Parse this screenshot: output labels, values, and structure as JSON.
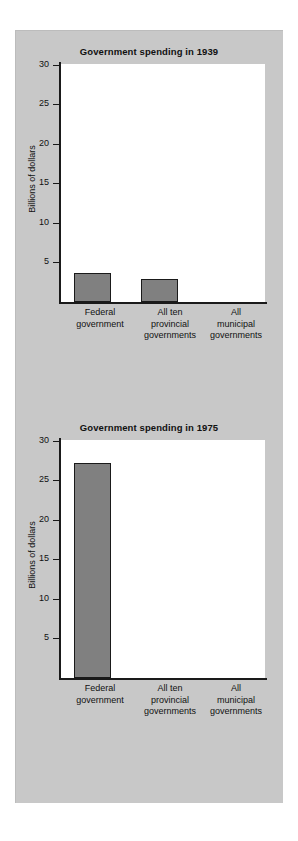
{
  "page": {
    "background_color": "#ffffff",
    "panel_color": "#c8c8c8"
  },
  "chart_data": [
    {
      "type": "bar",
      "title": "Government spending in 1939",
      "xlabel": "",
      "ylabel": "Billions of dollars",
      "categories": [
        "Federal government",
        "All ten provincial governments",
        "All municipal governments"
      ],
      "category_lines": [
        [
          "Federal",
          "government"
        ],
        [
          "All ten",
          "provincial",
          "governments"
        ],
        [
          "All",
          "municipal",
          "governments"
        ]
      ],
      "values": [
        3.8,
        3.1,
        0
      ],
      "ylim": [
        0,
        31.5
      ],
      "yticks": [
        5,
        10,
        15,
        20,
        25,
        30
      ],
      "ytick_labels": [
        "5",
        "10",
        "15",
        "20",
        "25",
        "30"
      ],
      "grid": false,
      "legend": "none",
      "bar_fill": "#808080",
      "bar_edge": "#1a1a1a"
    },
    {
      "type": "bar",
      "title": "Government spending in 1975",
      "xlabel": "",
      "ylabel": "Billions of dollars",
      "categories": [
        "Federal government",
        "All ten provincial governments",
        "All municipal governments"
      ],
      "category_lines": [
        [
          "Federal",
          "government"
        ],
        [
          "All ten",
          "provincial",
          "governments"
        ],
        [
          "All",
          "municipal",
          "governments"
        ]
      ],
      "values": [
        28.5,
        0,
        0
      ],
      "ylim": [
        0,
        31.5
      ],
      "yticks": [
        5,
        10,
        15,
        20,
        25,
        30
      ],
      "ytick_labels": [
        "5",
        "10",
        "15",
        "20",
        "25",
        "30"
      ],
      "grid": false,
      "legend": "none",
      "bar_fill": "#808080",
      "bar_edge": "#1a1a1a"
    }
  ]
}
